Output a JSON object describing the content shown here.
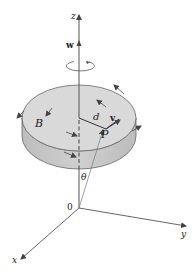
{
  "diagram": {
    "labels": {
      "z_axis": "z",
      "x_axis": "x",
      "y_axis": "y",
      "origin": "0",
      "angular_velocity": "w",
      "body": "B",
      "distance": "d",
      "velocity": "v",
      "point": "P",
      "angle": "θ"
    },
    "colors": {
      "disk_top": "#d9d9d9",
      "disk_side": "#c4c4c4",
      "stroke": "#555555",
      "text": "#222222"
    }
  }
}
